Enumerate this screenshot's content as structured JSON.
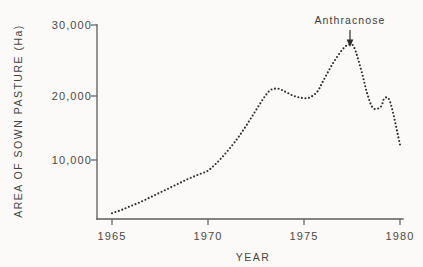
{
  "chart_data": {
    "type": "line",
    "title": "",
    "xlabel": "YEAR",
    "ylabel": "AREA OF SOWN PASTURE (Ha)",
    "xlim": [
      1965,
      1980
    ],
    "ylim": [
      0,
      30000
    ],
    "xticks": [
      1965,
      1970,
      1975,
      1980
    ],
    "xticklabels": [
      "1965",
      "1970",
      "1975",
      "1980"
    ],
    "yticks": [
      10000,
      20000,
      30000
    ],
    "yticklabels": [
      "10,000",
      "20,000",
      "30,000"
    ],
    "grid": false,
    "legend": false,
    "line_style": "dotted",
    "series": [
      {
        "name": "Area of sown pasture",
        "x": [
          1965.0,
          1965.5,
          1966.0,
          1966.5,
          1967.0,
          1967.5,
          1968.0,
          1968.5,
          1969.0,
          1969.5,
          1970.0,
          1970.5,
          1971.0,
          1971.5,
          1972.0,
          1972.5,
          1973.0,
          1973.3,
          1973.7,
          1974.0,
          1974.5,
          1975.0,
          1975.3,
          1975.7,
          1976.0,
          1976.5,
          1977.0,
          1977.3,
          1977.6,
          1978.0,
          1978.3,
          1978.6,
          1979.0,
          1979.2,
          1979.5,
          1980.0
        ],
        "values": [
          1700,
          2200,
          2800,
          3400,
          4100,
          4800,
          5500,
          6200,
          6900,
          7500,
          8100,
          9400,
          11000,
          12800,
          14900,
          17200,
          19400,
          20300,
          20400,
          20000,
          19300,
          19000,
          19100,
          20000,
          21600,
          24200,
          26300,
          27000,
          26700,
          23000,
          19600,
          17500,
          17700,
          19000,
          18300,
          12000
        ]
      }
    ],
    "annotations": [
      {
        "text": "Anthracnose",
        "x": 1977.5,
        "y": 30000,
        "arrow": true,
        "arrow_target_y": 27400
      }
    ]
  },
  "axis": {
    "y_label": "AREA OF SOWN PASTURE (Ha)",
    "x_label": "YEAR",
    "y_tick_top": "30,000",
    "y_tick_mid": "20,000",
    "y_tick_bottom": "10,000",
    "x_tick_1": "1965",
    "x_tick_2": "1970",
    "x_tick_3": "1975",
    "x_tick_4": "1980"
  },
  "annotation": {
    "anthracnose_label": "Anthracnose"
  },
  "colors": {
    "ink": "#2e2d2a",
    "axis": "#5d5c58",
    "text": "#46453f",
    "paper": "#fbfaf8"
  }
}
